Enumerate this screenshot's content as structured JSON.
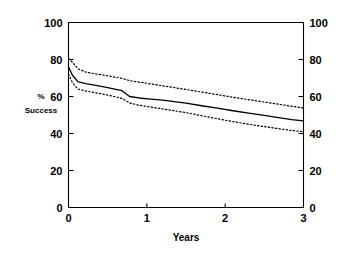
{
  "chart_data": {
    "type": "line",
    "title": "",
    "subtitle": "",
    "xlabel": "Years",
    "ylabel": "% Success",
    "ylabel_line1": "%",
    "ylabel_line2": "Success",
    "xlim": [
      0,
      3
    ],
    "ylim": [
      0,
      100
    ],
    "xticks": [
      0,
      1,
      2,
      3
    ],
    "xtick_labels": [
      "0",
      "1",
      "2",
      "3"
    ],
    "yticks": [
      0,
      20,
      40,
      60,
      80,
      100
    ],
    "ytick_labels": [
      "0",
      "20",
      "40",
      "60",
      "80",
      "100"
    ],
    "right_axis": true,
    "right_yticks": [
      0,
      20,
      40,
      60,
      80,
      100
    ],
    "right_ytick_labels": [
      "0",
      "20",
      "40",
      "60",
      "80",
      "100"
    ],
    "grid": false,
    "legend": "none",
    "line_color": "#000000",
    "background_color": "#ffffff",
    "series": [
      {
        "name": "Upper 95% confidence limit",
        "style": "dotted",
        "color": "#000000",
        "x": [
          0,
          0.05,
          0.12,
          0.22,
          0.35,
          0.5,
          0.68,
          0.78,
          0.9,
          1.05,
          1.2,
          1.35,
          1.5,
          1.7,
          1.9,
          2.1,
          2.3,
          2.5,
          2.7,
          2.85,
          3
        ],
        "values": [
          80.5,
          78.5,
          75.0,
          73.2,
          72.2,
          71.2,
          69.8,
          68.6,
          67.8,
          66.8,
          65.8,
          64.8,
          63.8,
          62.4,
          61.0,
          59.6,
          58.3,
          57.0,
          55.7,
          54.7,
          53.8
        ]
      },
      {
        "name": "Estimated success",
        "style": "solid",
        "color": "#000000",
        "x": [
          0,
          0.05,
          0.12,
          0.22,
          0.35,
          0.5,
          0.68,
          0.78,
          0.9,
          1.05,
          1.2,
          1.35,
          1.5,
          1.7,
          1.9,
          2.1,
          2.3,
          2.5,
          2.7,
          2.85,
          3
        ],
        "values": [
          76.0,
          71.5,
          68.0,
          67.0,
          66.0,
          64.8,
          63.2,
          60.0,
          59.2,
          58.6,
          58.0,
          57.2,
          56.4,
          55.0,
          53.7,
          52.3,
          51.0,
          49.8,
          48.5,
          47.5,
          46.8
        ]
      },
      {
        "name": "Lower 95% confidence limit",
        "style": "dotted",
        "color": "#000000",
        "x": [
          0,
          0.05,
          0.12,
          0.22,
          0.35,
          0.5,
          0.68,
          0.78,
          0.9,
          1.05,
          1.2,
          1.35,
          1.5,
          1.7,
          1.9,
          2.1,
          2.3,
          2.5,
          2.7,
          2.85,
          3
        ],
        "values": [
          72.0,
          67.5,
          64.0,
          63.0,
          62.0,
          60.8,
          59.0,
          56.5,
          55.3,
          54.3,
          53.3,
          52.3,
          51.3,
          49.6,
          48.0,
          46.4,
          45.0,
          43.7,
          42.5,
          41.6,
          41.0
        ]
      }
    ]
  }
}
